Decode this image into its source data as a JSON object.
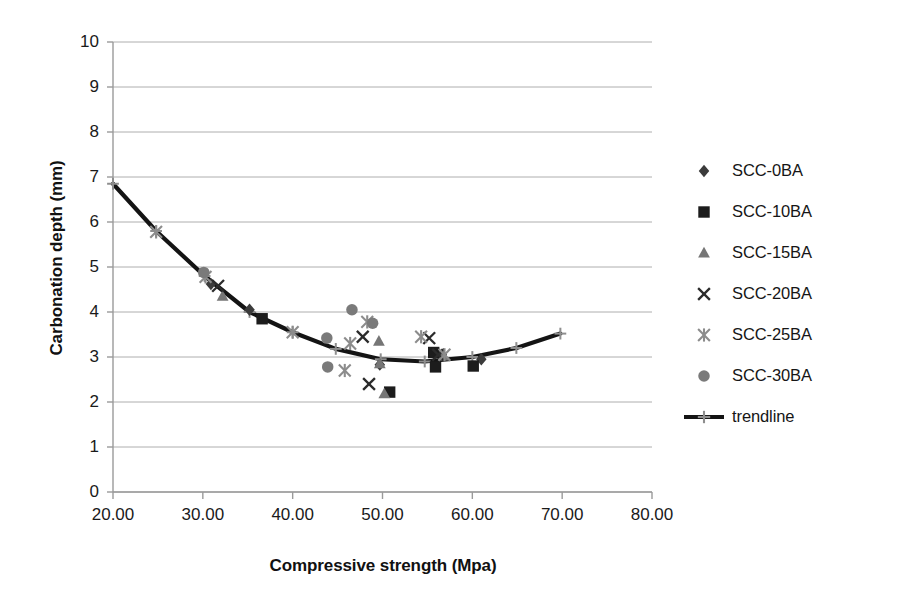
{
  "chart_data": {
    "type": "scatter",
    "title": "",
    "xlabel": "Compressive strength (Mpa)",
    "ylabel": "Carbonation depth (mm)",
    "xlim": [
      20,
      80
    ],
    "ylim": [
      0,
      10
    ],
    "xticks": [
      "20.00",
      "30.00",
      "40.00",
      "50.00",
      "60.00",
      "70.00",
      "80.00"
    ],
    "yticks": [
      "0",
      "1",
      "2",
      "3",
      "4",
      "5",
      "6",
      "7",
      "8",
      "9",
      "10"
    ],
    "grid": "horizontal",
    "legend_position": "right",
    "series": [
      {
        "name": "SCC-0BA",
        "marker": "diamond",
        "color": "#3b3b3b",
        "points": [
          [
            30.9,
            4.62
          ],
          [
            35.2,
            4.05
          ],
          [
            49.7,
            2.83
          ],
          [
            56.6,
            3.05
          ],
          [
            61.0,
            2.95
          ]
        ]
      },
      {
        "name": "SCC-10BA",
        "marker": "square",
        "color": "#1c1c1c",
        "points": [
          [
            36.6,
            3.85
          ],
          [
            50.8,
            2.22
          ],
          [
            55.7,
            3.1
          ],
          [
            55.9,
            2.78
          ],
          [
            60.1,
            2.8
          ]
        ]
      },
      {
        "name": "SCC-15BA",
        "marker": "triangle",
        "color": "#767676",
        "points": [
          [
            32.2,
            4.35
          ],
          [
            49.6,
            3.35
          ],
          [
            49.7,
            2.85
          ],
          [
            50.2,
            2.18
          ],
          [
            56.8,
            3.02
          ]
        ]
      },
      {
        "name": "SCC-20BA",
        "marker": "cross",
        "color": "#2b2b2b",
        "points": [
          [
            31.7,
            4.58
          ],
          [
            47.8,
            3.45
          ],
          [
            48.5,
            2.4
          ],
          [
            55.2,
            3.42
          ],
          [
            56.2,
            3.05
          ]
        ]
      },
      {
        "name": "SCC-25BA",
        "marker": "asterisk",
        "color": "#8c8c8c",
        "points": [
          [
            24.8,
            5.78
          ],
          [
            30.3,
            4.78
          ],
          [
            40.0,
            3.55
          ],
          [
            46.4,
            3.3
          ],
          [
            45.8,
            2.7
          ],
          [
            48.3,
            3.78
          ],
          [
            54.3,
            3.45
          ],
          [
            56.9,
            3.05
          ]
        ]
      },
      {
        "name": "SCC-30BA",
        "marker": "circle",
        "color": "#7a7a7a",
        "points": [
          [
            30.1,
            4.88
          ],
          [
            43.8,
            3.42
          ],
          [
            43.9,
            2.78
          ],
          [
            46.6,
            4.05
          ],
          [
            48.9,
            3.75
          ]
        ]
      }
    ],
    "trendline": {
      "name": "trendline",
      "marker": "plus",
      "color": "#141414",
      "points": [
        [
          20.0,
          6.85
        ],
        [
          24.8,
          5.8
        ],
        [
          30.2,
          4.8
        ],
        [
          35.2,
          4.0
        ],
        [
          40.0,
          3.55
        ],
        [
          44.8,
          3.18
        ],
        [
          49.8,
          2.95
        ],
        [
          54.7,
          2.9
        ],
        [
          60.0,
          3.0
        ],
        [
          64.9,
          3.2
        ],
        [
          69.8,
          3.52
        ]
      ]
    }
  },
  "legend": {
    "items": [
      {
        "label": "SCC-0BA"
      },
      {
        "label": "SCC-10BA"
      },
      {
        "label": "SCC-15BA"
      },
      {
        "label": "SCC-20BA"
      },
      {
        "label": "SCC-25BA"
      },
      {
        "label": "SCC-30BA"
      },
      {
        "label": "trendline"
      }
    ]
  }
}
